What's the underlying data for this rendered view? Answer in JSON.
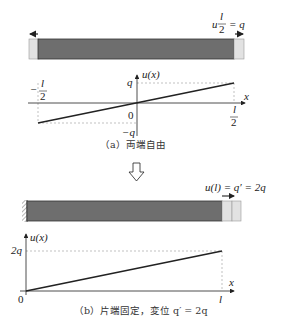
{
  "figure_a": {
    "caption": "（a）両端自由",
    "bar_label": {
      "u": "u",
      "frac_num": "l",
      "frac_den": "2",
      "eq": "= q"
    },
    "graph": {
      "y_axis_label": "u(x)",
      "x_axis_label": "x",
      "y_top_label": "q",
      "y_bottom_label": "−q",
      "origin_label": "0",
      "x_left_label_num": "l",
      "x_left_label_den": "2",
      "x_left_sign": "−",
      "x_right_label_num": "l",
      "x_right_label_den": "2"
    }
  },
  "transition_arrow": "down-hollow-arrow",
  "figure_b": {
    "caption": "（b）片端固定，変位 q′ = 2q",
    "bar_label": "u(l) = q′ = 2q",
    "graph": {
      "y_axis_label": "u(x)",
      "x_axis_label": "x",
      "y_top_label": "2q",
      "origin_label": "0",
      "x_right_label": "l"
    }
  },
  "colors": {
    "bar_fill": "#6e6e6e",
    "end_fill": "#e2e2e2",
    "line": "#222222",
    "dashed": "#999999"
  }
}
